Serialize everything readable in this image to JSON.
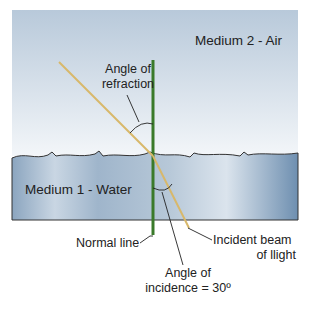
{
  "diagram": {
    "labels": {
      "medium_air": "Medium 2 - Air",
      "medium_water": "Medium 1 - Water",
      "angle_refraction_line1": "Angle of",
      "angle_refraction_line2": "refraction",
      "normal_line": "Normal line",
      "incident_beam_line1": "Incident beam",
      "incident_beam_line2": "of llight",
      "angle_incidence_line1": "Angle of",
      "angle_incidence_line2": "incidence = 30º"
    },
    "colors": {
      "air_top": "#b7c8d9",
      "air_bottom": "#f2f5f8",
      "water_dark": "#7f9cb8",
      "water_light": "#e4ebf2",
      "normal_line": "#3a7a2a",
      "light_beam": "#d8b86a",
      "outline": "#333333"
    },
    "angle_of_incidence_deg": 30
  }
}
